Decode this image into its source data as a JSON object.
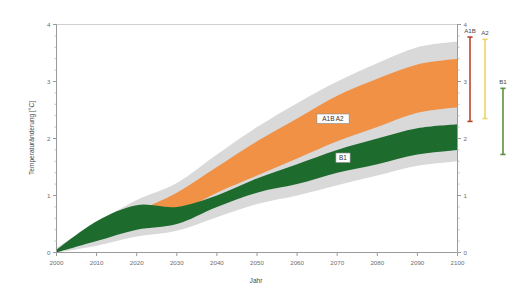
{
  "chart_data": {
    "type": "area",
    "title": "",
    "xlabel": "Jahr",
    "ylabel": "Temperaturänderung [°C]",
    "xlim": [
      2000,
      2100
    ],
    "ylim": [
      0,
      4
    ],
    "xticks": [
      "2000",
      "2010",
      "2020",
      "2030",
      "2040",
      "2050",
      "2060",
      "2070",
      "2080",
      "2090",
      "2100"
    ],
    "yticks": [
      "0",
      "1",
      "2",
      "3",
      "4"
    ],
    "grid": false,
    "legend_position": "inside-right",
    "x": [
      2000,
      2010,
      2020,
      2030,
      2040,
      2050,
      2060,
      2070,
      2080,
      2090,
      2100
    ],
    "series": [
      {
        "name": "A1B A2",
        "color": "#F09146",
        "label": "A1B  A2",
        "lower": [
          0.0,
          0.25,
          0.45,
          0.7,
          1.05,
          1.35,
          1.65,
          1.95,
          2.2,
          2.45,
          2.55
        ],
        "upper": [
          0.05,
          0.4,
          0.72,
          1.05,
          1.5,
          1.95,
          2.35,
          2.75,
          3.05,
          3.3,
          3.4
        ]
      },
      {
        "name": "B1",
        "color": "#1E6B2E",
        "label": "B1",
        "lower": [
          0.0,
          0.2,
          0.4,
          0.5,
          0.8,
          1.05,
          1.2,
          1.4,
          1.55,
          1.72,
          1.8
        ],
        "upper": [
          0.05,
          0.55,
          0.83,
          0.8,
          1.0,
          1.3,
          1.55,
          1.8,
          2.0,
          2.18,
          2.25
        ]
      }
    ],
    "envelope": {
      "name": "Unsicherheitsbereich",
      "color": "#D9D9D9",
      "lower": [
        0.0,
        0.12,
        0.28,
        0.38,
        0.62,
        0.85,
        1.0,
        1.18,
        1.35,
        1.52,
        1.6
      ],
      "upper": [
        0.08,
        0.52,
        0.92,
        1.22,
        1.72,
        2.2,
        2.62,
        3.0,
        3.32,
        3.6,
        3.7
      ]
    },
    "error_bars": [
      {
        "name": "A1B",
        "label": "A1B",
        "color": "#B8452F",
        "low": 2.3,
        "high": 3.78,
        "x_px": 470
      },
      {
        "name": "A2",
        "label": "A2",
        "color": "#EFD467",
        "low": 2.35,
        "high": 3.74,
        "x_px": 485
      },
      {
        "name": "B1",
        "label": "B1",
        "color": "#5C9143",
        "low": 1.72,
        "high": 2.88,
        "x_px": 503
      }
    ],
    "right_axis": {
      "ticks": [
        "0",
        "1",
        "2",
        "3",
        "4"
      ],
      "min": 0,
      "max": 4
    },
    "inline_labels": [
      {
        "text": "A1B  A2",
        "x_px": 333,
        "y_px": 121
      },
      {
        "text": "B1",
        "x_px": 343,
        "y_px": 160
      }
    ]
  },
  "colors": {
    "axis": "#9a9a9a",
    "tick_text": "#6e6e6e",
    "band_orange": "#F09146",
    "band_green": "#1E6B2E",
    "envelope_gray": "#D9D9D9",
    "errbar_a1b": "#B8452F",
    "errbar_a2": "#EFD467",
    "errbar_b1": "#5C9143"
  }
}
